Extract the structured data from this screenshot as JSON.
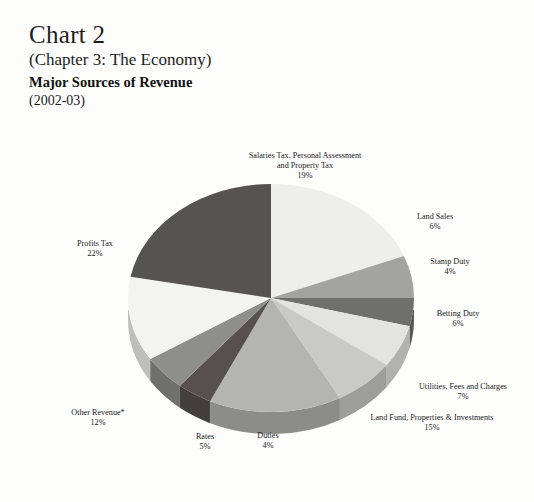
{
  "header": {
    "chart_number": "Chart 2",
    "chapter_ref": "(Chapter 3: The Economy)",
    "subject_title": "Major Sources of Revenue",
    "period": "(2002-03)"
  },
  "chart_data": {
    "type": "pie",
    "title": "Major Sources of Revenue",
    "subtitle": "(2002-03)",
    "units": "percent",
    "three_d": true,
    "legend_position": "none",
    "labels_position": "outside",
    "start_angle_deg": 0,
    "direction": "clockwise",
    "categories": [
      "Salaries Tax, Personal Assessment and Property Tax",
      "Land Sales",
      "Stamp Duty",
      "Betting Duty",
      "Utilities, Fees and Charges",
      "Land Fund, Properties & Investments",
      "Duties",
      "Rates",
      "Other Revenue*",
      "Profits Tax"
    ],
    "values": [
      19,
      6,
      4,
      6,
      7,
      15,
      4,
      5,
      12,
      22
    ],
    "value_labels": [
      "19%",
      "6%",
      "4%",
      "6%",
      "7%",
      "15%",
      "4%",
      "5%",
      "12%",
      "22%"
    ],
    "colors": [
      "#eeeeec",
      "#a3a3a1",
      "#6f6f6e",
      "#e3e3e1",
      "#c9c9c7",
      "#b4b4b2",
      "#57504f",
      "#8e8e8c",
      "#f3f3f1",
      "#565453"
    ]
  },
  "labels": {
    "salaries": {
      "line1": "Salaries Tax, Personal Assessment",
      "line2": "and Property Tax",
      "pct": "19%"
    },
    "land_sales": {
      "name": "Land Sales",
      "pct": "6%"
    },
    "stamp_duty": {
      "name": "Stamp Duty",
      "pct": "4%"
    },
    "betting_duty": {
      "name": "Betting Duty",
      "pct": "6%"
    },
    "utilities": {
      "name": "Utilities, Fees and Charges",
      "pct": "7%"
    },
    "land_fund": {
      "name": "Land Fund, Properties & Investments",
      "pct": "15%"
    },
    "duties": {
      "name": "Duties",
      "pct": "4%"
    },
    "rates": {
      "name": "Rates",
      "pct": "5%"
    },
    "other": {
      "name": "Other Revenue*",
      "pct": "12%"
    },
    "profits_tax": {
      "name": "Profits Tax",
      "pct": "22%"
    }
  }
}
